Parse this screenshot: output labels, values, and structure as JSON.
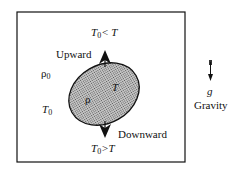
{
  "diagram": {
    "top_condition": {
      "base": "T",
      "sub": "0",
      "rest": "< T"
    },
    "bottom_condition": {
      "base": "T",
      "sub": "0",
      "rest": ">T"
    },
    "upward_label": "Upward",
    "downward_label": "Downward",
    "ambient_density": {
      "base": "ρ",
      "sub": "0"
    },
    "ambient_temperature": {
      "base": "T",
      "sub": "0"
    },
    "parcel_density": "ρ",
    "parcel_temperature": "T",
    "gravity_symbol": "g",
    "gravity_label": "Gravity",
    "colors": {
      "parcel_fill": "#8a8a8a",
      "stroke": "#111111"
    }
  }
}
